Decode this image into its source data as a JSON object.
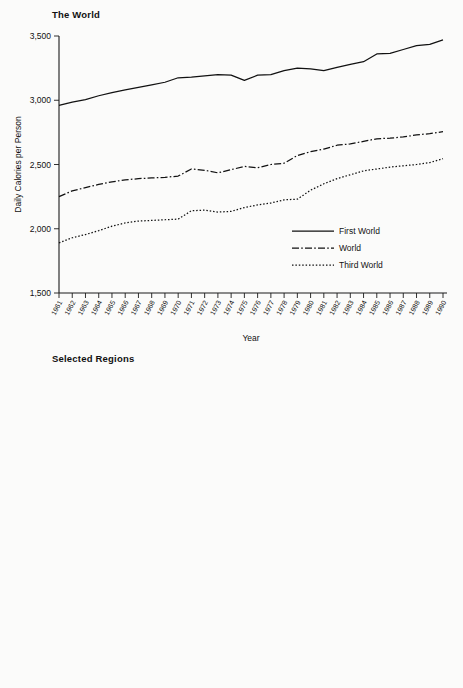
{
  "figure": {
    "background": "#fbfbfa",
    "ink": "#111111"
  },
  "panels": [
    {
      "id": "the-world",
      "title": "The World",
      "ylabel": "Daily Calories per Person",
      "xlabel": "Year"
    },
    {
      "id": "selected-regions",
      "title": "Selected Regions",
      "ylabel": "Daily Calories per Person",
      "xlabel": "Year"
    }
  ],
  "chart_data": [
    {
      "type": "line",
      "title": "The World",
      "xlabel": "Year",
      "ylabel": "Daily Calories per Person",
      "grid": false,
      "legend_position": "bottom-right",
      "ylim": [
        1500,
        3500
      ],
      "yticks": [
        1500,
        2000,
        2500,
        3000,
        3500
      ],
      "ytick_labels": [
        "1,500",
        "2,000",
        "2,500",
        "3,000",
        "3,500"
      ],
      "x": [
        1961,
        1962,
        1963,
        1964,
        1965,
        1966,
        1967,
        1968,
        1969,
        1970,
        1971,
        1972,
        1973,
        1974,
        1975,
        1976,
        1977,
        1978,
        1979,
        1980,
        1981,
        1982,
        1983,
        1984,
        1985,
        1986,
        1987,
        1988,
        1989,
        1990
      ],
      "xtick_labels": [
        "1961",
        "1962",
        "1963",
        "1964",
        "1965",
        "1966",
        "1967",
        "1968",
        "1969",
        "1970",
        "1971",
        "1972",
        "1973",
        "1974",
        "1975",
        "1976",
        "1977",
        "1978",
        "1979",
        "1980",
        "1981",
        "1982",
        "1983",
        "1984",
        "1985",
        "1986",
        "1987",
        "1988",
        "1989",
        "1990"
      ],
      "series": [
        {
          "name": "First World",
          "dash": "solid",
          "values": [
            2960,
            2985,
            3005,
            3035,
            3060,
            3080,
            3100,
            3120,
            3140,
            3175,
            3180,
            3190,
            3200,
            3195,
            3155,
            3195,
            3200,
            3230,
            3250,
            3245,
            3230,
            3255,
            3280,
            3300,
            3360,
            3365,
            3395,
            3425,
            3435,
            3470
          ]
        },
        {
          "name": "World",
          "dash": "dashdot",
          "values": [
            2250,
            2295,
            2320,
            2345,
            2365,
            2380,
            2390,
            2395,
            2400,
            2410,
            2465,
            2455,
            2435,
            2460,
            2485,
            2475,
            2500,
            2510,
            2570,
            2600,
            2620,
            2650,
            2660,
            2680,
            2700,
            2705,
            2715,
            2730,
            2740,
            2755
          ]
        },
        {
          "name": "Third World",
          "dash": "dotted",
          "values": [
            1890,
            1930,
            1955,
            1985,
            2020,
            2045,
            2060,
            2065,
            2070,
            2075,
            2140,
            2145,
            2130,
            2135,
            2165,
            2185,
            2200,
            2225,
            2230,
            2300,
            2350,
            2390,
            2420,
            2450,
            2465,
            2480,
            2490,
            2500,
            2515,
            2545
          ]
        }
      ]
    },
    {
      "type": "line",
      "title": "Selected Regions",
      "xlabel": "Year",
      "ylabel": "Daily Calories per Person",
      "grid": false,
      "legend_position": "top-left",
      "ylim": [
        1900,
        2960
      ],
      "yticks": [
        1900,
        2100,
        2300,
        2500,
        2700,
        2900
      ],
      "ytick_labels": [
        "1,900",
        "2,100",
        "2,300",
        "2,500",
        "2,700",
        "2,900"
      ],
      "x": [
        1961,
        1962,
        1963,
        1964,
        1965,
        1966,
        1967,
        1968,
        1969,
        1970,
        1971,
        1972,
        1973,
        1974,
        1975,
        1976,
        1977,
        1978,
        1979,
        1980,
        1981,
        1982,
        1983,
        1984,
        1985,
        1986,
        1987,
        1988,
        1989,
        1990
      ],
      "xtick_labels": [
        "1961",
        "1962",
        "1963",
        "1964",
        "1965",
        "1966",
        "1967",
        "1968",
        "1969",
        "1970",
        "1971",
        "1972",
        "1973",
        "1974",
        "1975",
        "1976",
        "1977",
        "1978",
        "1979",
        "1980",
        "1981",
        "1982",
        "1983",
        "1984",
        "1985",
        "1986",
        "1987",
        "1988",
        "1989",
        "1990"
      ],
      "series": [
        {
          "name": "South America",
          "dash": "solid",
          "values": [
            2400,
            2425,
            2390,
            2440,
            2475,
            2460,
            2490,
            2535,
            2520,
            2520,
            2515,
            2490,
            2440,
            2530,
            2540,
            2565,
            2595,
            2620,
            2650,
            2655,
            2620,
            2590,
            2565,
            2570,
            2535,
            2580,
            2600,
            2615,
            2595,
            2570
          ]
        },
        {
          "name": "North Africa/Middle East",
          "dash": "dashdot",
          "values": [
            2145,
            2165,
            2180,
            2200,
            2215,
            2240,
            2270,
            2290,
            2305,
            2330,
            2355,
            2385,
            2425,
            2475,
            2530,
            2590,
            2650,
            2700,
            2760,
            2800,
            2840,
            2865,
            2885,
            2895,
            2900,
            2900,
            2905,
            2905,
            2905,
            2905
          ]
        },
        {
          "name": "Sub-Saharan Africa",
          "dash": "dotted",
          "values": [
            2145,
            2155,
            2165,
            2170,
            2175,
            2150,
            2150,
            2175,
            2210,
            2230,
            2200,
            2180,
            2195,
            2230,
            2215,
            2205,
            2200,
            2190,
            2195,
            2230,
            2235,
            2230,
            2195,
            2130,
            2175,
            2235,
            2200,
            2190,
            2225,
            2185
          ]
        },
        {
          "name": "South Asia",
          "dash": "dashdotdot",
          "values": [
            1905,
            1930,
            1950,
            1965,
            1965,
            1915,
            1935,
            1975,
            1980,
            2010,
            2015,
            1980,
            1955,
            1985,
            1950,
            2020,
            1975,
            2110,
            2075,
            2045,
            2040,
            2040,
            2075,
            2115,
            2160,
            2145,
            2175,
            2195,
            2215,
            2175
          ]
        }
      ]
    }
  ]
}
